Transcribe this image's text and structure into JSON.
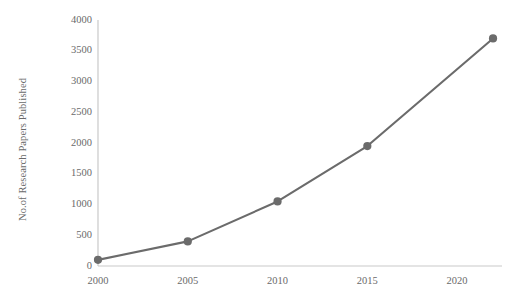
{
  "chart_data": {
    "type": "line",
    "title": "",
    "subtitle": "",
    "xlabel": "",
    "ylabel": "No.of Research Papers Published",
    "x": [
      2000,
      2005,
      2010,
      2015,
      2022
    ],
    "categories": [
      "2000",
      "2005",
      "2010",
      "2015",
      "2022"
    ],
    "values": [
      100,
      400,
      1050,
      1950,
      3700
    ],
    "series": [
      {
        "name": "No.of Research Papers Published",
        "values": [
          100,
          400,
          1050,
          1950,
          3700
        ]
      }
    ],
    "xlim": [
      2000,
      2022.5
    ],
    "ylim": [
      0,
      4000
    ],
    "xticks": [
      2000,
      2005,
      2010,
      2015,
      2020
    ],
    "xticklabels": [
      "2000",
      "2005",
      "2010",
      "2015",
      "2020"
    ],
    "yticks": [
      0,
      500,
      1000,
      1500,
      2000,
      2500,
      3000,
      3500,
      4000
    ],
    "yticklabels": [
      "0",
      "500",
      "1000",
      "1500",
      "2000",
      "2500",
      "3000",
      "3500",
      "4000"
    ],
    "grid": false,
    "legend": false,
    "legend_position": "none",
    "marker": "circle",
    "line_color": "#6b6b6b",
    "marker_color": "#6b6b6b",
    "axis_color": "#c9c9c9",
    "tick_label_color": "#6a6a6a",
    "background_color": "#ffffff",
    "annotations": []
  },
  "geometry": {
    "plot_left": 98,
    "plot_right": 502,
    "plot_top": 20,
    "plot_bottom": 266
  }
}
